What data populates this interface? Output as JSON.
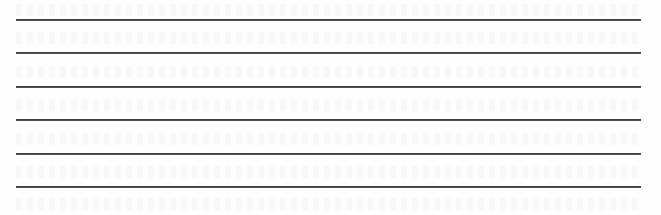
{
  "sheet": {
    "type": "ruled-writing-area",
    "background_color": "#ffffff",
    "line_color": "#333333",
    "line_count": 6,
    "lines": [
      {
        "index": 1,
        "y": 19
      },
      {
        "index": 2,
        "y": 52
      },
      {
        "index": 3,
        "y": 86
      },
      {
        "index": 4,
        "y": 119
      },
      {
        "index": 5,
        "y": 153
      },
      {
        "index": 6,
        "y": 186
      }
    ],
    "line_x_start": 16,
    "line_x_end": 641
  }
}
